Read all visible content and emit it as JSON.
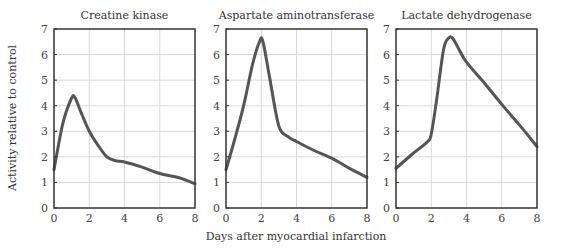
{
  "chart_data": [
    {
      "type": "line",
      "title": "Creatine kinase",
      "xlabel": "",
      "ylabel": "Activity relative to control",
      "xlim": [
        0,
        8
      ],
      "ylim": [
        0,
        7
      ],
      "xticks": [
        0,
        2,
        4,
        6,
        8
      ],
      "yticks": [
        0,
        1,
        2,
        3,
        4,
        5,
        6,
        7
      ],
      "grid": true,
      "series": [
        {
          "name": "Creatine kinase",
          "x": [
            0,
            0.5,
            1.0,
            1.2,
            1.5,
            2.0,
            2.5,
            3.0,
            3.5,
            4.0,
            5.0,
            6.0,
            7.0,
            8.0
          ],
          "y": [
            1.5,
            3.3,
            4.3,
            4.3,
            3.8,
            3.0,
            2.45,
            2.0,
            1.85,
            1.8,
            1.6,
            1.35,
            1.2,
            0.95
          ]
        }
      ]
    },
    {
      "type": "line",
      "title": "Aspartate aminotransferase",
      "xlabel": "Days after myocardial infarction",
      "ylabel": "",
      "xlim": [
        0,
        8
      ],
      "ylim": [
        0,
        7
      ],
      "xticks": [
        0,
        2,
        4,
        6,
        8
      ],
      "yticks": [
        0,
        1,
        2,
        3,
        4,
        5,
        6,
        7
      ],
      "grid": true,
      "series": [
        {
          "name": "Aspartate aminotransferase",
          "x": [
            0,
            0.5,
            1.0,
            1.5,
            1.9,
            2.1,
            2.5,
            3.0,
            3.5,
            4.0,
            5.0,
            6.0,
            7.0,
            8.0
          ],
          "y": [
            1.5,
            2.7,
            4.0,
            5.6,
            6.5,
            6.5,
            5.0,
            3.2,
            2.8,
            2.6,
            2.25,
            1.95,
            1.55,
            1.2
          ]
        }
      ]
    },
    {
      "type": "line",
      "title": "Lactate dehydrogenase",
      "xlabel": "",
      "ylabel": "",
      "xlim": [
        0,
        8
      ],
      "ylim": [
        0,
        7
      ],
      "xticks": [
        0,
        2,
        4,
        6,
        8
      ],
      "yticks": [
        0,
        1,
        2,
        3,
        4,
        5,
        6,
        7
      ],
      "grid": true,
      "series": [
        {
          "name": "Lactate dehydrogenase",
          "x": [
            0,
            1.0,
            1.8,
            2.0,
            2.3,
            2.7,
            3.0,
            3.2,
            3.5,
            4.0,
            5.0,
            6.0,
            7.0,
            8.0
          ],
          "y": [
            1.55,
            2.15,
            2.6,
            2.9,
            4.2,
            6.2,
            6.65,
            6.65,
            6.3,
            5.7,
            4.9,
            4.05,
            3.25,
            2.4
          ]
        }
      ]
    }
  ],
  "style": {
    "curve_color": "#555555",
    "grid_color": "#d8d8d8",
    "frame_color": "#333333"
  }
}
